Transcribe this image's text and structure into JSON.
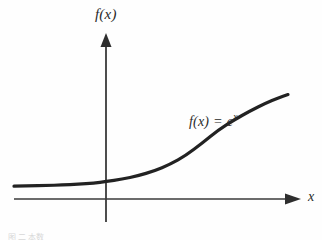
{
  "figure": {
    "background_color": "#fefefe",
    "ink_color": "#2a2a2a",
    "axis_color": "#3a3a3a",
    "caption_fragment": "图 二 本数"
  },
  "labels": {
    "y_axis": "f(x)",
    "x_axis": "x",
    "equation_lhs": "f(x)",
    "equation_op": " = ",
    "equation_base": "e",
    "equation_exponent": "x"
  },
  "chart_data": {
    "type": "line",
    "title": "",
    "subtitle": "",
    "xlabel": "x",
    "ylabel": "f(x)",
    "grid": false,
    "legend": false,
    "annotations": [
      {
        "text": "f(x) = e^x",
        "x_px": 189,
        "y_px": 113,
        "describes": "exponential curve"
      }
    ],
    "axes": {
      "x_axis_y_px": 199,
      "y_axis_x_px": 106,
      "x_axis_start_px": 14,
      "x_axis_end_px": 300,
      "y_axis_top_px": 35,
      "y_axis_bottom_px": 222,
      "x_arrowhead": true,
      "y_arrowhead": true,
      "tick_marks": false,
      "tick_labels": []
    },
    "series": [
      {
        "name": "f(x) = e^x",
        "formula": "exp(x)",
        "color": "#222222",
        "linewidth_px": 3.2,
        "x": [
          -4.6,
          -4.0,
          -3.4,
          -2.8,
          -2.2,
          -1.6,
          -1.0,
          -0.4,
          0.0,
          0.4,
          0.8,
          1.2,
          1.6,
          2.0,
          2.3
        ],
        "y": [
          0.01,
          0.018,
          0.033,
          0.061,
          0.111,
          0.202,
          0.368,
          0.67,
          1.0,
          1.492,
          2.226,
          3.32,
          4.953,
          7.389,
          9.974
        ]
      }
    ],
    "xlim": [
      -4.6,
      2.6
    ],
    "ylim": [
      0,
      11
    ],
    "curve_pixel_path": [
      [
        14,
        186.2
      ],
      [
        30,
        185.9
      ],
      [
        46,
        185.5
      ],
      [
        62,
        185.0
      ],
      [
        78,
        184.2
      ],
      [
        94,
        183.0
      ],
      [
        106,
        181.6
      ],
      [
        122,
        179.2
      ],
      [
        138,
        175.8
      ],
      [
        154,
        171.0
      ],
      [
        170,
        164.4
      ],
      [
        186,
        155.4
      ],
      [
        202,
        143.2
      ],
      [
        218,
        130.2
      ],
      [
        234,
        120.0
      ],
      [
        250,
        111.0
      ],
      [
        266,
        103.0
      ],
      [
        278,
        98.0
      ],
      [
        288,
        94.6
      ]
    ]
  }
}
